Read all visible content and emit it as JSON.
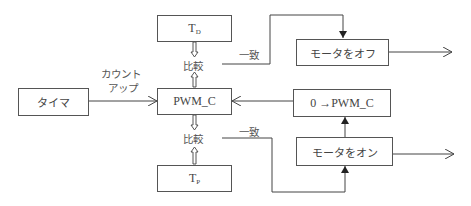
{
  "diagram": {
    "type": "block-diagram",
    "nodes": {
      "timer": {
        "label": "タイマ"
      },
      "pwm_c": {
        "label": "PWM_C"
      },
      "td": {
        "label": "T",
        "subscript": "D"
      },
      "tp": {
        "label": "T",
        "subscript": "P"
      },
      "motor_off": {
        "label": "モータをオフ"
      },
      "reset_pwm": {
        "label": "0 →PWM_C"
      },
      "motor_on": {
        "label": "モータをオン"
      }
    },
    "labels": {
      "count_up_line1": "カウント",
      "count_up_line2": "アップ",
      "compare_upper": "比較",
      "compare_lower": "比較",
      "match_upper": "一致",
      "match_lower": "一致"
    },
    "edges": [
      {
        "from": "timer",
        "to": "pwm_c",
        "label": "カウントアップ"
      },
      {
        "from": "td",
        "to": "compare_upper",
        "style": "double-arrow"
      },
      {
        "from": "pwm_c",
        "to": "compare_upper",
        "style": "double-arrow"
      },
      {
        "from": "pwm_c",
        "to": "compare_lower",
        "style": "double-arrow"
      },
      {
        "from": "tp",
        "to": "compare_lower",
        "style": "double-arrow"
      },
      {
        "from": "compare_upper",
        "to": "motor_off",
        "label": "一致"
      },
      {
        "from": "compare_lower",
        "to": "motor_on",
        "label": "一致"
      },
      {
        "from": "motor_on",
        "to": "reset_pwm"
      },
      {
        "from": "reset_pwm",
        "to": "pwm_c"
      },
      {
        "from": "motor_off",
        "to": "output"
      },
      {
        "from": "motor_on",
        "to": "output"
      }
    ]
  }
}
